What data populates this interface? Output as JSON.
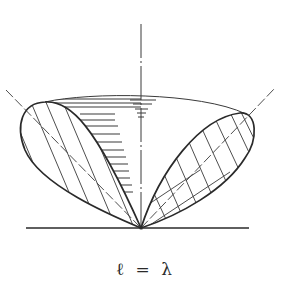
{
  "figure": {
    "type": "radiation-pattern-diagram",
    "caption": "ℓ = λ",
    "colors": {
      "line": "#2a2a2a",
      "background": "#ffffff",
      "hatch": "#3a3a3a"
    },
    "elements": {
      "ground_line": "baseline",
      "vertical_axis": "dash-dot",
      "left_lobe": "diagonal-hatched",
      "right_lobe": "cross-hatched",
      "cone_rim": "thin arc with horizontal hatching",
      "lobe_axes": "dashed"
    }
  }
}
